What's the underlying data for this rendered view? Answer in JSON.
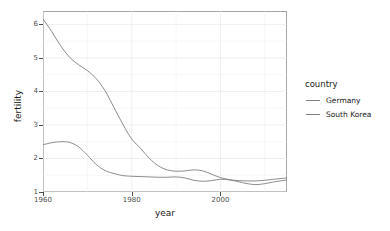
{
  "chart_data": {
    "type": "line",
    "title": "",
    "xlabel": "year",
    "ylabel": "fertility",
    "xlim": [
      1960,
      2015
    ],
    "ylim": [
      1,
      6.4
    ],
    "xticks": [
      1960,
      1980,
      2000
    ],
    "yticks": [
      1,
      2,
      3,
      4,
      5,
      6
    ],
    "grid": true,
    "legend_position": "right",
    "legend_title": "country",
    "series": [
      {
        "name": "Germany",
        "color": "#7f7f7f",
        "x": [
          1960,
          1962,
          1964,
          1966,
          1968,
          1970,
          1972,
          1974,
          1976,
          1978,
          1980,
          1982,
          1984,
          1986,
          1988,
          1990,
          1992,
          1994,
          1996,
          1998,
          2000,
          2002,
          2004,
          2006,
          2008,
          2010,
          2012,
          2015
        ],
        "values": [
          2.41,
          2.47,
          2.5,
          2.48,
          2.35,
          2.1,
          1.82,
          1.64,
          1.55,
          1.49,
          1.47,
          1.46,
          1.45,
          1.44,
          1.44,
          1.45,
          1.42,
          1.35,
          1.32,
          1.34,
          1.38,
          1.36,
          1.31,
          1.25,
          1.22,
          1.25,
          1.3,
          1.36
        ]
      },
      {
        "name": "South Korea",
        "color": "#7f7f7f",
        "x": [
          1960,
          1962,
          1964,
          1966,
          1968,
          1970,
          1972,
          1974,
          1976,
          1978,
          1980,
          1982,
          1984,
          1986,
          1988,
          1990,
          1992,
          1994,
          1996,
          1998,
          2000,
          2002,
          2004,
          2006,
          2008,
          2010,
          2012,
          2015
        ],
        "values": [
          6.16,
          5.78,
          5.36,
          5.02,
          4.8,
          4.62,
          4.38,
          4.02,
          3.52,
          3.02,
          2.58,
          2.3,
          2.0,
          1.78,
          1.66,
          1.62,
          1.63,
          1.66,
          1.63,
          1.53,
          1.43,
          1.37,
          1.34,
          1.33,
          1.33,
          1.35,
          1.38,
          1.42
        ]
      }
    ]
  },
  "legend": {
    "title": "country",
    "items": [
      {
        "label": "Germany"
      },
      {
        "label": "South Korea"
      }
    ]
  },
  "axes": {
    "x_title": "year",
    "y_title": "fertility",
    "x_tick_labels": [
      "1960",
      "1980",
      "2000"
    ],
    "y_tick_labels": [
      "1",
      "2",
      "3",
      "4",
      "5",
      "6"
    ]
  },
  "style": {
    "panel_background": "#ffffff",
    "panel_border": "#a6a6a6",
    "grid_color": "#ebebeb",
    "line_color": "#7f7f7f",
    "text_color": "#1a1a1a",
    "tick_color": "#4d4d4d"
  }
}
